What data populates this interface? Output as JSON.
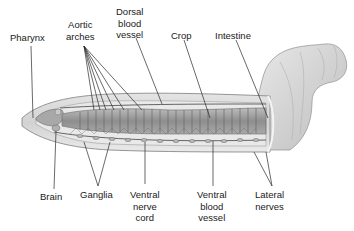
{
  "diagram": {
    "labels": {
      "pharynx": "Pharynx",
      "aortic_arches": "Aortic\narches",
      "dorsal_blood_vessel": "Dorsal\nblood\nvessel",
      "crop": "Crop",
      "intestine": "Intestine",
      "brain": "Brain",
      "ganglia": "Ganglia",
      "ventral_nerve_cord": "Ventral\nnerve\ncord",
      "ventral_blood_vessel": "Ventral\nblood\nvessel",
      "lateral_nerves": "Lateral\nnerves"
    },
    "colors": {
      "background": "#ffffff",
      "body_skin": "#d6d6d6",
      "body_outline": "#8a8a8a",
      "organs": "#9a9a9a",
      "leader_line": "#2a2a2a",
      "text": "#1a1a1a"
    }
  }
}
